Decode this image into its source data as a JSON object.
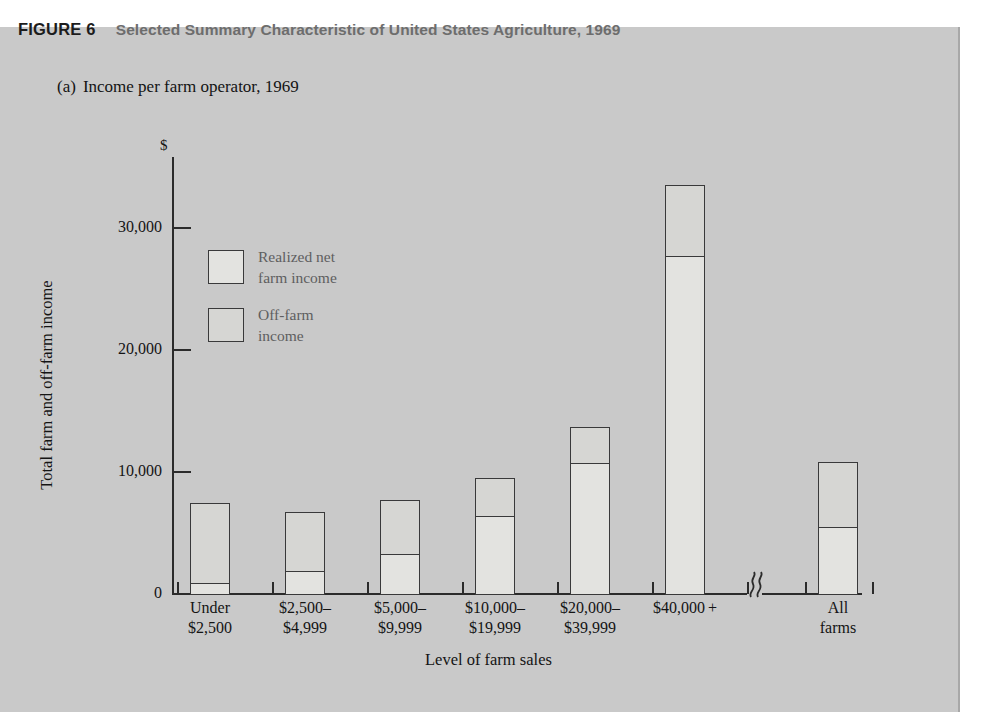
{
  "figure": {
    "tag": "FIGURE 6",
    "title": "Selected Summary Characteristic of United States Agriculture, 1969",
    "subtitle_letter": "(a)",
    "subtitle_text": "Income per farm operator, 1969"
  },
  "chart_data": {
    "type": "bar",
    "subtype": "stacked-bar",
    "title": "Income per farm operator, 1969",
    "xlabel": "Level of farm sales",
    "ylabel": "Total farm and off-farm income",
    "y_unit": "$",
    "ylim": [
      0,
      36000
    ],
    "yticks": [
      0,
      10000,
      20000,
      30000
    ],
    "ytick_labels": [
      "0",
      "10,000",
      "20,000",
      "30,000"
    ],
    "grid": false,
    "axis_break_after_category": "$40,000+",
    "legend_position": "inside-upper-left",
    "categories": [
      "Under $2,500",
      "$2,500–$4,999",
      "$5,000–$9,999",
      "$10,000–$19,999",
      "$20,000–$39,999",
      "$40,000+",
      "All farms"
    ],
    "category_lines": [
      [
        "Under",
        "$2,500"
      ],
      [
        "$2,500–",
        "$4,999"
      ],
      [
        "$5,000–",
        "$9,999"
      ],
      [
        "$10,000–",
        "$19,999"
      ],
      [
        "$20,000–",
        "$39,999"
      ],
      [
        "$40,000 +",
        ""
      ],
      [
        "All",
        "farms"
      ]
    ],
    "series": [
      {
        "name": "Realized net farm income",
        "legend_lines": [
          "Realized net",
          "farm income"
        ],
        "color": "#e3e3e0",
        "values": [
          900,
          1900,
          3300,
          6400,
          10700,
          27700,
          5500
        ]
      },
      {
        "name": "Off-farm income",
        "legend_lines": [
          "Off-farm",
          "income"
        ],
        "color": "#d6d6d3",
        "values": [
          6600,
          4800,
          4400,
          3100,
          3000,
          5800,
          5300
        ]
      }
    ],
    "totals": [
      7500,
      6700,
      7700,
      9500,
      13700,
      33500,
      10800
    ]
  },
  "colors": {
    "panel_background": "#c9c9c9",
    "ink": "#141414",
    "axis": "#2b2b2b",
    "title_gray": "#6d6d6d",
    "legend_text": "#5e5e60"
  }
}
